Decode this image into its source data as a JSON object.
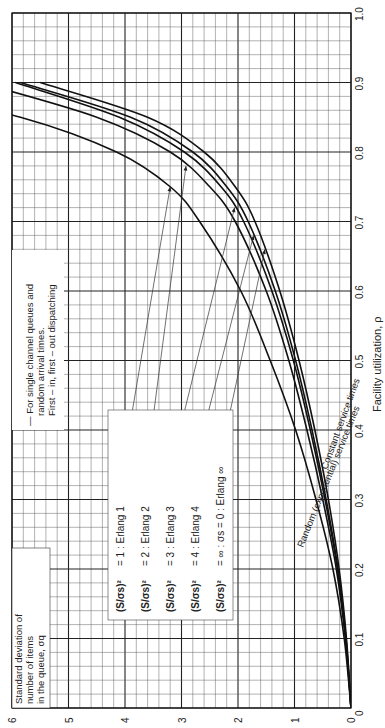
{
  "chart_data": {
    "type": "line",
    "orientation": "rotated-90-ccw",
    "title": "",
    "xlabel": "Facility utilization, ρ",
    "ylabel": "Standard deviation of number of items in the queue, σq",
    "xlim": [
      0,
      1.0
    ],
    "ylim": [
      0,
      6
    ],
    "x_ticks": [
      "0",
      "0.1",
      "0.2",
      "0.3",
      "0.4",
      "0.5",
      "0.6",
      "0.7",
      "0.8",
      "0.9",
      "1.0"
    ],
    "y_ticks": [
      "0",
      "1",
      "2",
      "3",
      "4",
      "5",
      "6"
    ],
    "grid": true,
    "x": [
      0.0,
      0.1,
      0.2,
      0.3,
      0.4,
      0.5,
      0.6,
      0.7,
      0.75,
      0.8,
      0.85,
      0.9
    ],
    "series": [
      {
        "name": "(S/σs)² = 1: Erlang 1",
        "values": [
          0.0,
          0.12,
          0.32,
          0.62,
          0.98,
          1.43,
          1.95,
          2.68,
          3.2,
          4.15,
          5.85,
          null
        ]
      },
      {
        "name": "(S/σs)² = 2: Erlang 2",
        "values": [
          0.0,
          0.1,
          0.26,
          0.5,
          0.78,
          1.1,
          1.5,
          2.05,
          2.5,
          3.2,
          4.5,
          null
        ]
      },
      {
        "name": "(S/σs)² = 3: Erlang 3",
        "values": [
          0.0,
          0.09,
          0.24,
          0.46,
          0.72,
          1.02,
          1.4,
          1.9,
          2.3,
          2.95,
          4.1,
          null
        ]
      },
      {
        "name": "(S/σs)² = 4: Erlang 4",
        "values": [
          0.0,
          0.09,
          0.23,
          0.44,
          0.69,
          0.98,
          1.34,
          1.82,
          2.2,
          2.8,
          3.9,
          5.85
        ]
      },
      {
        "name": "(S/σs)² = ∞: σs = 0: Erlang ∞",
        "values": [
          0.0,
          0.08,
          0.21,
          0.4,
          0.64,
          0.92,
          1.26,
          1.7,
          2.05,
          2.6,
          3.6,
          5.5
        ]
      }
    ],
    "annotations": [
      "— For single channel queues and random arrival times. First–in, first–out dispatching",
      "Random (exponential) service times",
      "Constant service times"
    ],
    "legend_position": "inside, center (labels with leader arrows)"
  },
  "labels": {
    "xlabel": "Facility utilization, ρ",
    "ylabel_line1": "Standard deviation of",
    "ylabel_line2": "number of items",
    "ylabel_line3": "in the queue, σq",
    "note_line1": "— For single channel queues and",
    "note_line2": "random arrival times.",
    "note_line3": "First – in, first – out dispatching",
    "random_label": "Random (exponential) service times",
    "constant_label": "Constant service times",
    "legend": [
      {
        "suffix": "= 1 : Erlang 1"
      },
      {
        "suffix": "= 2 : Erlang 2"
      },
      {
        "suffix": "= 3 : Erlang 3"
      },
      {
        "suffix": "= 4 : Erlang 4"
      },
      {
        "suffix": "= ∞ : σs = 0 : Erlang ∞"
      }
    ],
    "legend_prefix": "(S/σs)²"
  }
}
